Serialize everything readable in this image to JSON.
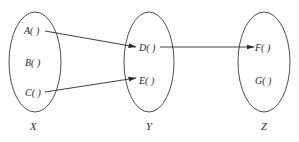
{
  "diagram": {
    "type": "mapping-between-sets",
    "colors": {
      "stroke": "#3a3a3a",
      "text": "#2a2a2a",
      "background": "#ffffff"
    },
    "sets": [
      {
        "id": "X",
        "label": "X",
        "elements": [
          {
            "id": "A",
            "label": "A( )"
          },
          {
            "id": "B",
            "label": "B( )"
          },
          {
            "id": "C",
            "label": "C( )"
          }
        ]
      },
      {
        "id": "Y",
        "label": "Y",
        "elements": [
          {
            "id": "D",
            "label": "D( )"
          },
          {
            "id": "E",
            "label": "E( )"
          }
        ]
      },
      {
        "id": "Z",
        "label": "Z",
        "elements": [
          {
            "id": "F",
            "label": "F( )"
          },
          {
            "id": "G",
            "label": "G( )"
          }
        ]
      }
    ],
    "arrows": [
      {
        "from": "A",
        "to": "D"
      },
      {
        "from": "C",
        "to": "E"
      },
      {
        "from": "D",
        "to": "F"
      }
    ]
  }
}
